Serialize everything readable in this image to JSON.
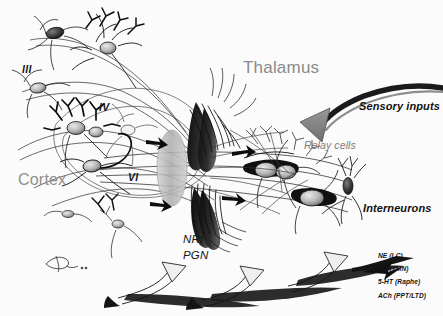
{
  "figure": {
    "background_color": "#fbfbfb",
    "ink_color": "#111111",
    "gray_label_color": "#8a8a8a"
  },
  "labels": {
    "thalamus": "Thalamus",
    "cortex": "Cortex",
    "sensory_inputs": "Sensory inputs",
    "relay_cells": "Relay cells",
    "interneurons": "Interneurons",
    "nrt": "NRt",
    "pgn": "PGN"
  },
  "cortical_layers": [
    {
      "id": "layer-3",
      "label": "III"
    },
    {
      "id": "layer-4",
      "label": "IV"
    },
    {
      "id": "layer-6",
      "label": "VI"
    }
  ],
  "neuromodulators": [
    {
      "transmitter": "NE",
      "nucleus": "LC",
      "label": "NE (LC)"
    },
    {
      "transmitter": "HA",
      "nucleus": "TMN",
      "label": "HA (TMN)"
    },
    {
      "transmitter": "5-HT",
      "nucleus": "Raphe",
      "label": "5-HT (Raphe)"
    },
    {
      "transmitter": "ACh",
      "nucleus": "PPT/LTD",
      "label": "ACh (PPT/LTD)"
    }
  ],
  "signature": {
    "artist_mark": "BdC",
    "year_mark": "93"
  }
}
